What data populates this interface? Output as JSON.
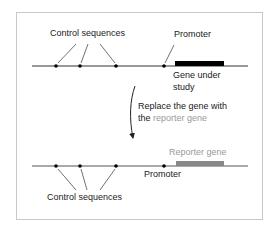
{
  "diagram": {
    "top": {
      "control_label": "Control sequences",
      "promoter_label": "Promoter",
      "gene_label_line1": "Gene under",
      "gene_label_line2": "study"
    },
    "transition": {
      "line1": "Replace the gene with",
      "line2_prefix": "the",
      "line2_highlight": "reporter gene"
    },
    "bottom": {
      "reporter_label": "Reporter gene",
      "promoter_label": "Promoter",
      "control_label": "Control sequences"
    },
    "colors": {
      "gene": "#000000",
      "reporter": "#888888",
      "reporter_text": "#9a9a9a",
      "line": "#333333",
      "border": "#c8c8c8"
    }
  }
}
